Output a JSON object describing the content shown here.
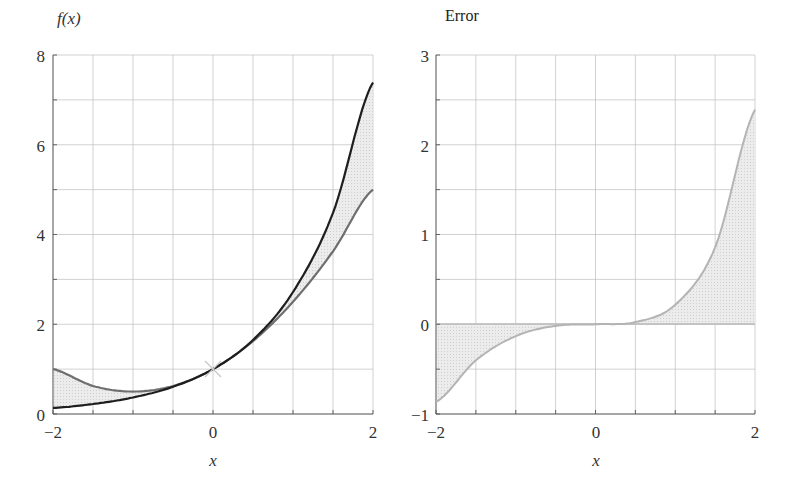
{
  "chart_data": [
    {
      "type": "line",
      "title": "f(x)",
      "xlabel": "x",
      "ylabel": "f(x)",
      "xlim": [
        -2,
        2
      ],
      "ylim": [
        0,
        8
      ],
      "xticks": [
        "-2",
        "0",
        "2"
      ],
      "yticks": [
        "0",
        "2",
        "4",
        "6",
        "8"
      ],
      "grid": true,
      "x": [
        -2,
        -1.5,
        -1,
        -0.5,
        0,
        0.5,
        1,
        1.5,
        2
      ],
      "series": [
        {
          "name": "exp(x)",
          "color": "#1e1e1e",
          "values": [
            0.135,
            0.223,
            0.368,
            0.607,
            1.0,
            1.649,
            2.718,
            4.482,
            7.389
          ]
        },
        {
          "name": "1 + x + x^2/2",
          "color": "#6e6e6e",
          "values": [
            1.0,
            0.625,
            0.5,
            0.625,
            1.0,
            1.625,
            2.5,
            3.625,
            5.0
          ]
        }
      ],
      "annotations": [
        "shaded region between curves",
        "x marker at (0, 1)"
      ]
    },
    {
      "type": "area",
      "title": "Error",
      "xlabel": "x",
      "ylabel": "Error",
      "xlim": [
        -2,
        2
      ],
      "ylim": [
        -1,
        3
      ],
      "xticks": [
        "-2",
        "0",
        "2"
      ],
      "yticks": [
        "-1",
        "0",
        "1",
        "2",
        "3"
      ],
      "grid": true,
      "x": [
        -2,
        -1.5,
        -1,
        -0.5,
        0,
        0.5,
        1,
        1.5,
        2
      ],
      "series": [
        {
          "name": "exp(x) - (1 + x + x^2/2)",
          "color": "#b0b0b0",
          "values": [
            -0.865,
            -0.402,
            -0.132,
            -0.018,
            0.0,
            0.024,
            0.218,
            0.857,
            2.389
          ]
        }
      ]
    }
  ],
  "left": {
    "title": "f(x)",
    "xlabel": "x",
    "xticks": [
      "−2",
      "0",
      "2"
    ],
    "yticks": [
      "0",
      "2",
      "4",
      "6",
      "8"
    ]
  },
  "right": {
    "title": "Error",
    "xlabel": "x",
    "xticks": [
      "−2",
      "0",
      "2"
    ],
    "yticks": [
      "−1",
      "0",
      "1",
      "2",
      "3"
    ]
  }
}
